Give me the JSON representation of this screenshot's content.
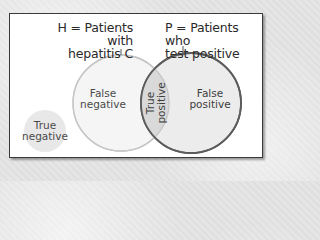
{
  "diagram": {
    "type": "venn",
    "sets": {
      "H": {
        "label_line1": "H = Patients with",
        "label_line2": "hepatitis C",
        "fill": "#f4f4f4",
        "stroke": "#c4c4c4"
      },
      "P": {
        "label_line1": "P = Patients who",
        "label_line2": "test positive",
        "fill": "#ececec",
        "stroke": "#5a5a5a"
      }
    },
    "regions": {
      "false_negative": {
        "line1": "False",
        "line2": "negative"
      },
      "true_positive": {
        "line1": "True",
        "line2": "positive",
        "fill": "#d8d8d8"
      },
      "false_positive": {
        "line1": "False",
        "line2": "positive"
      },
      "true_negative": {
        "line1": "True",
        "line2": "negative",
        "fill": "#e6e6e6"
      }
    }
  }
}
